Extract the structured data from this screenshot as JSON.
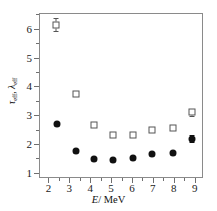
{
  "chart_data": {
    "type": "scatter",
    "title": "",
    "xlabel": "E/MeV",
    "ylabel": "τeff, λeff",
    "xlim": [
      1.55,
      9.4
    ],
    "ylim": [
      0.82,
      6.55
    ],
    "xticks": [
      2,
      3,
      4,
      5,
      6,
      7,
      8,
      9
    ],
    "yticks": [
      1,
      2,
      3,
      4,
      5,
      6
    ],
    "xticklabels": [
      "2",
      "3",
      "4",
      "5",
      "6",
      "7",
      "8",
      "9"
    ],
    "yticklabels": [
      "1",
      "2",
      "3",
      "4",
      "5",
      "6"
    ],
    "grid": false,
    "legend": "none",
    "series": [
      {
        "name": "open-squares",
        "marker": "open-square",
        "color": "#555555",
        "points": [
          {
            "x": 2.35,
            "y": 6.15,
            "yerr": 0.22
          },
          {
            "x": 3.3,
            "y": 3.72,
            "yerr": 0.06
          },
          {
            "x": 4.2,
            "y": 2.67,
            "yerr": 0.07
          },
          {
            "x": 5.1,
            "y": 2.32,
            "yerr": 0.07
          },
          {
            "x": 6.05,
            "y": 2.32,
            "yerr": 0.07
          },
          {
            "x": 6.95,
            "y": 2.5,
            "yerr": 0.05
          },
          {
            "x": 7.95,
            "y": 2.57,
            "yerr": 0.04
          },
          {
            "x": 8.85,
            "y": 3.1,
            "yerr": 0.13
          }
        ]
      },
      {
        "name": "filled-circles",
        "marker": "filled-circle",
        "color": "#111111",
        "points": [
          {
            "x": 2.4,
            "y": 2.68,
            "yerr": 0.0
          },
          {
            "x": 3.3,
            "y": 1.76,
            "yerr": 0.0
          },
          {
            "x": 4.2,
            "y": 1.47,
            "yerr": 0.0
          },
          {
            "x": 5.1,
            "y": 1.43,
            "yerr": 0.0
          },
          {
            "x": 6.05,
            "y": 1.5,
            "yerr": 0.0
          },
          {
            "x": 6.95,
            "y": 1.64,
            "yerr": 0.0
          },
          {
            "x": 7.95,
            "y": 1.68,
            "yerr": 0.0
          },
          {
            "x": 8.85,
            "y": 2.19,
            "yerr": 0.12
          }
        ]
      }
    ]
  },
  "axis_titles": {
    "x_symbol": "E",
    "x_rest": "/ MeV",
    "y_sym1": "τ",
    "y_sub1": "eff",
    "y_comma": ", ",
    "y_sym2": "λ",
    "y_sub2": "eff"
  }
}
